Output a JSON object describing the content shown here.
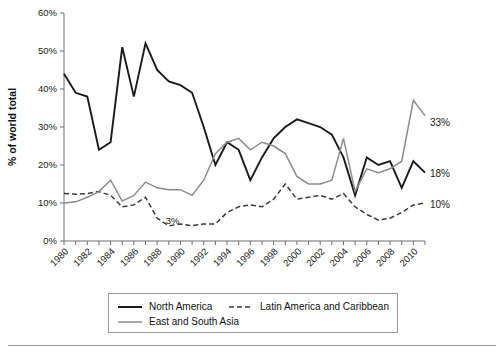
{
  "chart_data": {
    "type": "line",
    "title": "",
    "xlabel": "",
    "ylabel": "% of world total",
    "xlim": [
      1980,
      2011
    ],
    "ylim": [
      0,
      60
    ],
    "grid": false,
    "legend_position": "bottom",
    "x": [
      1980,
      1981,
      1982,
      1983,
      1984,
      1985,
      1986,
      1987,
      1988,
      1989,
      1990,
      1991,
      1992,
      1993,
      1994,
      1995,
      1996,
      1997,
      1998,
      1999,
      2000,
      2001,
      2002,
      2003,
      2004,
      2005,
      2006,
      2007,
      2008,
      2009,
      2010,
      2011
    ],
    "xtick_labels": [
      "1980",
      "1982",
      "1984",
      "1986",
      "1988",
      "1990",
      "1992",
      "1994",
      "1996",
      "1998",
      "2000",
      "2002",
      "2004",
      "2006",
      "2008",
      "2010"
    ],
    "ytick_labels": [
      "0%",
      "10%",
      "20%",
      "30%",
      "40%",
      "50%",
      "60%"
    ],
    "ytick_values": [
      0,
      10,
      20,
      30,
      40,
      50,
      60
    ],
    "series": [
      {
        "name": "North America",
        "style": "solid",
        "color": "#1a1a1a",
        "width": 1.9,
        "values": [
          44,
          39,
          38,
          24,
          26,
          51,
          38,
          52,
          45,
          42,
          41,
          39,
          30,
          20,
          26,
          24,
          16,
          22,
          27,
          30,
          32,
          31,
          30,
          28,
          22,
          12,
          22,
          20,
          21,
          14,
          21,
          18
        ]
      },
      {
        "name": "Latin America and Caribbean",
        "style": "dashed",
        "color": "#3a3a3a",
        "width": 1.5,
        "values": [
          12.5,
          12.3,
          12.5,
          13,
          12,
          9,
          9.5,
          11.5,
          6,
          4,
          4.5,
          4,
          4.5,
          4.5,
          7.5,
          9,
          9.5,
          9,
          11,
          15,
          11,
          11.5,
          12,
          11,
          12.5,
          9,
          7,
          5.5,
          6,
          7.5,
          9.5,
          10
        ]
      },
      {
        "name": "East and South Asia",
        "style": "solid",
        "color": "#8c8c8c",
        "width": 1.5,
        "values": [
          10,
          10.3,
          11.5,
          13,
          16,
          10.5,
          12,
          15.5,
          14,
          13.5,
          13.5,
          12,
          16,
          23,
          26,
          27,
          24,
          26,
          25,
          23,
          17,
          15,
          15,
          16,
          27,
          13,
          19,
          18,
          19,
          21,
          37,
          33
        ]
      }
    ],
    "annotations": [
      {
        "name": "asia-end-label",
        "text": "33%",
        "x": 2011,
        "y": 33
      },
      {
        "name": "north-america-end-label",
        "text": "18%",
        "x": 2011,
        "y": 18
      },
      {
        "name": "latin-america-end-label",
        "text": "10%",
        "x": 2011,
        "y": 10
      },
      {
        "name": "latin-america-min-label",
        "text": "3%",
        "x": 1989,
        "y": 3
      }
    ]
  },
  "legend": {
    "items": [
      {
        "label": "North America",
        "style": "solid",
        "color": "#1a1a1a"
      },
      {
        "label": "Latin America and Caribbean",
        "style": "dashed",
        "color": "#3a3a3a"
      },
      {
        "label": "East and South Asia",
        "style": "solid",
        "color": "#8c8c8c"
      }
    ]
  }
}
